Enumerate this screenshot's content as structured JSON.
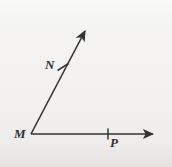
{
  "figure": {
    "kind": "geometry-angle-diagram",
    "background_color": "#f1f0ef",
    "stroke_color": "#333333",
    "labels": {
      "vertex": "M",
      "ray_upper_point": "N",
      "ray_lower_point": "P"
    },
    "geometry": {
      "vertex": {
        "x": 31,
        "y": 134
      },
      "ray_upper": {
        "from": {
          "x": 31,
          "y": 134
        },
        "to": {
          "x": 89,
          "y": 24
        },
        "arrowhead": true,
        "tick_at": {
          "x": 63,
          "y": 67
        }
      },
      "ray_lower": {
        "from": {
          "x": 31,
          "y": 134
        },
        "to": {
          "x": 160,
          "y": 134
        },
        "arrowhead": true,
        "tick_at": {
          "x": 108,
          "y": 134
        }
      }
    }
  }
}
